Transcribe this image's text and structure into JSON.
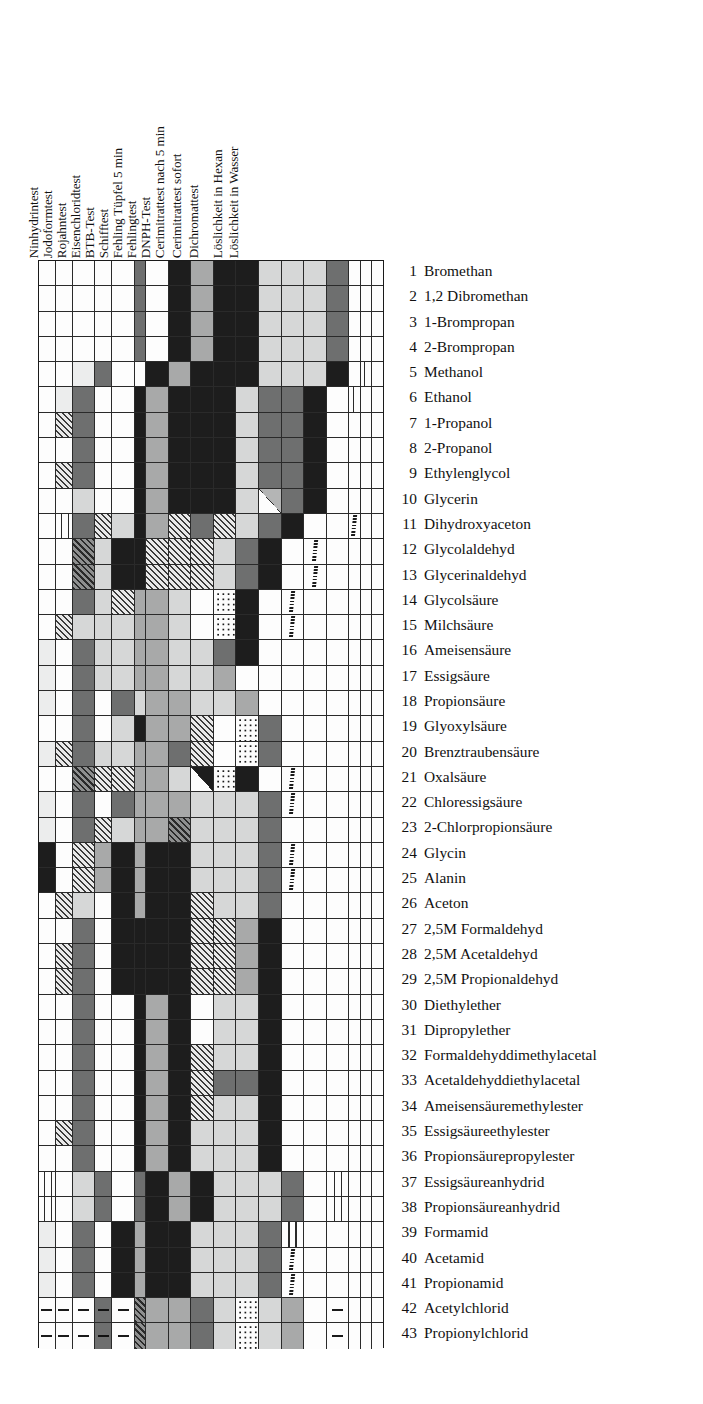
{
  "figure": {
    "caption": ""
  },
  "chart_data": {
    "type": "heatmap",
    "xlabel": "",
    "ylabel": "",
    "grid": true,
    "legend_position": "none",
    "orientation": "columns = tests (rotated labels, left to right), rows = substances 1..43",
    "categories": [
      "Ninhydrintest",
      "Jodoformtest",
      "Rojahntest",
      "Eisenchloridtest",
      "BTB-Test",
      "Schifftest",
      "Fehling Tüpfel 5 min",
      "Fehlingtest",
      "DNPH-Test",
      "Cerimitrattest nach 5 min",
      "Cerimitrattest sofort",
      "Dichromattest",
      "Löslichkeit in Hexan",
      "Löslichkeit in Wasser"
    ],
    "column_labels": [
      "Ninhydrintest",
      "Jodoformtest",
      "Rojahntest",
      "Eisenchloridtest",
      "BTB-Test",
      "Schifftest",
      "Fehling Tüpfel 5 min",
      "Fehlingtest",
      "DNPH-Test",
      "Cerimitrattest nach 5 min",
      "Cerimitrattest sofort",
      "Dichromattest",
      "Löslichkeit in Hexan",
      "Löslichkeit in Wasser"
    ],
    "value_scale": {
      "w": "white / no reaction",
      "vl": "very light gray",
      "l": "light gray",
      "m": "medium gray",
      "d": "dark gray",
      "k": "black / strong reaction",
      "h": "hatched (diagonal)",
      "hd": "dark hatched",
      "dot": "dotted",
      "tri": "split cell (diagonal)",
      "sq": "wavy-line marker",
      "dash": "dash marker"
    },
    "rows": [
      {
        "n": "1",
        "name": "Bromethan",
        "cells": [
          "w",
          "w",
          "w",
          "w",
          "w",
          "d",
          "w",
          "k",
          "m",
          "k",
          "k",
          "l",
          "l",
          "l",
          "d",
          "w",
          "w",
          "w"
        ]
      },
      {
        "n": "2",
        "name": "1,2 Dibromethan",
        "cells": [
          "w",
          "w",
          "w",
          "w",
          "w",
          "d",
          "w",
          "k",
          "m",
          "k",
          "k",
          "l",
          "l",
          "l",
          "d",
          "w",
          "w",
          "w"
        ]
      },
      {
        "n": "3",
        "name": "1-Brompropan",
        "cells": [
          "w",
          "w",
          "w",
          "w",
          "w",
          "d",
          "w",
          "k",
          "m",
          "k",
          "k",
          "l",
          "l",
          "l",
          "d",
          "w",
          "w",
          "w"
        ]
      },
      {
        "n": "4",
        "name": "2-Brompropan",
        "cells": [
          "w",
          "w",
          "w",
          "w",
          "w",
          "d",
          "w",
          "k",
          "m",
          "k",
          "k",
          "l",
          "l",
          "l",
          "d",
          "w",
          "w",
          "w"
        ]
      },
      {
        "n": "5",
        "name": "Methanol",
        "cells": [
          "w",
          "w",
          "vl",
          "d",
          "w",
          "w",
          "k",
          "m",
          "k",
          "k",
          "k",
          "l",
          "l",
          "l",
          "k",
          "w",
          "wv",
          "w"
        ]
      },
      {
        "n": "6",
        "name": "Ethanol",
        "cells": [
          "w",
          "vl",
          "d",
          "w",
          "w",
          "k",
          "m",
          "k",
          "k",
          "k",
          "l",
          "d",
          "d",
          "k",
          "w",
          "wv",
          "w",
          "w"
        ]
      },
      {
        "n": "7",
        "name": "1-Propanol",
        "cells": [
          "w",
          "h",
          "d",
          "w",
          "w",
          "k",
          "m",
          "k",
          "k",
          "k",
          "l",
          "d",
          "d",
          "k",
          "w",
          "w",
          "w",
          "w"
        ]
      },
      {
        "n": "8",
        "name": "2-Propanol",
        "cells": [
          "w",
          "w",
          "d",
          "w",
          "w",
          "k",
          "m",
          "k",
          "k",
          "k",
          "l",
          "d",
          "d",
          "k",
          "w",
          "w",
          "w",
          "w"
        ]
      },
      {
        "n": "9",
        "name": "Ethylenglycol",
        "cells": [
          "w",
          "h",
          "d",
          "w",
          "w",
          "k",
          "m",
          "k",
          "k",
          "k",
          "l",
          "d",
          "d",
          "k",
          "w",
          "w",
          "w",
          "w"
        ]
      },
      {
        "n": "10",
        "name": "Glycerin",
        "cells": [
          "w",
          "w",
          "l",
          "w",
          "w",
          "k",
          "m",
          "k",
          "k",
          "k",
          "l",
          "tri",
          "d",
          "k",
          "w",
          "w",
          "w",
          "w"
        ]
      },
      {
        "n": "11",
        "name": "Dihydroxyaceton",
        "cells": [
          "w",
          "wv",
          "d",
          "h",
          "l",
          "k",
          "m",
          "h",
          "d",
          "h",
          "l",
          "d",
          "k",
          "w",
          "w",
          "sq",
          "w",
          "w"
        ]
      },
      {
        "n": "12",
        "name": "Glycolaldehyd",
        "cells": [
          "w",
          "w",
          "hd",
          "l",
          "k",
          "k",
          "h",
          "h",
          "h",
          "l",
          "d",
          "k",
          "w",
          "sq",
          "w",
          "w",
          "w",
          "w"
        ]
      },
      {
        "n": "13",
        "name": "Glycerinaldehyd",
        "cells": [
          "w",
          "w",
          "hd",
          "l",
          "k",
          "k",
          "h",
          "h",
          "h",
          "l",
          "d",
          "k",
          "w",
          "sq",
          "w",
          "w",
          "w",
          "w"
        ]
      },
      {
        "n": "14",
        "name": "Glycolsäure",
        "cells": [
          "w",
          "w",
          "d",
          "l",
          "h",
          "m",
          "m",
          "l",
          "w",
          "dot",
          "k",
          "w",
          "sq",
          "w",
          "w",
          "w",
          "w",
          "w"
        ]
      },
      {
        "n": "15",
        "name": "Milchsäure",
        "cells": [
          "w",
          "h",
          "l",
          "l",
          "l",
          "m",
          "m",
          "l",
          "w",
          "dot",
          "k",
          "w",
          "sq",
          "w",
          "w",
          "w",
          "w",
          "w"
        ]
      },
      {
        "n": "16",
        "name": "Ameisensäure",
        "cells": [
          "vl",
          "w",
          "d",
          "l",
          "l",
          "m",
          "m",
          "l",
          "l",
          "d",
          "k",
          "w",
          "w",
          "w",
          "w",
          "w",
          "w",
          "w"
        ]
      },
      {
        "n": "17",
        "name": "Essigsäure",
        "cells": [
          "vl",
          "w",
          "d",
          "l",
          "l",
          "m",
          "m",
          "l",
          "l",
          "m",
          "w",
          "w",
          "w",
          "w",
          "w",
          "w",
          "w",
          "w"
        ]
      },
      {
        "n": "18",
        "name": "Propionsäure",
        "cells": [
          "vl",
          "w",
          "d",
          "w",
          "d",
          "l",
          "m",
          "m",
          "l",
          "l",
          "m",
          "w",
          "w",
          "w",
          "w",
          "w",
          "w",
          "w"
        ]
      },
      {
        "n": "19",
        "name": "Glyoxylsäure",
        "cells": [
          "w",
          "w",
          "d",
          "w",
          "l",
          "k",
          "m",
          "m",
          "h",
          "w",
          "dot",
          "d",
          "w",
          "w",
          "w",
          "w",
          "w",
          "w"
        ]
      },
      {
        "n": "20",
        "name": "Brenztraubensäure",
        "cells": [
          "vl",
          "h",
          "d",
          "l",
          "l",
          "m",
          "m",
          "d",
          "h",
          "w",
          "dot",
          "d",
          "w",
          "w",
          "w",
          "w",
          "w",
          "w"
        ]
      },
      {
        "n": "21",
        "name": "Oxalsäure",
        "cells": [
          "w",
          "w",
          "hd",
          "h",
          "h",
          "m",
          "m",
          "l",
          "tri2",
          "dot",
          "k",
          "w",
          "sq",
          "w",
          "w",
          "w",
          "w",
          "w"
        ]
      },
      {
        "n": "22",
        "name": "Chloressigsäure",
        "cells": [
          "vl",
          "w",
          "d",
          "w",
          "d",
          "m",
          "m",
          "m",
          "l",
          "l",
          "l",
          "d",
          "sq",
          "w",
          "w",
          "w",
          "w",
          "w"
        ]
      },
      {
        "n": "23",
        "name": "2-Chlorpropionsäure",
        "cells": [
          "vl",
          "w",
          "d",
          "h",
          "l",
          "m",
          "m",
          "hd",
          "l",
          "l",
          "l",
          "d",
          "w",
          "w",
          "w",
          "w",
          "w",
          "w"
        ]
      },
      {
        "n": "24",
        "name": "Glycin",
        "cells": [
          "k",
          "w",
          "h",
          "m",
          "k",
          "m",
          "k",
          "k",
          "l",
          "l",
          "l",
          "d",
          "sq",
          "w",
          "w",
          "w",
          "w",
          "w"
        ]
      },
      {
        "n": "25",
        "name": "Alanin",
        "cells": [
          "k",
          "w",
          "h",
          "m",
          "k",
          "m",
          "k",
          "k",
          "l",
          "l",
          "l",
          "d",
          "sq",
          "w",
          "w",
          "w",
          "w",
          "w"
        ]
      },
      {
        "n": "26",
        "name": "Aceton",
        "cells": [
          "w",
          "h",
          "l",
          "w",
          "k",
          "m",
          "k",
          "k",
          "h",
          "l",
          "l",
          "d",
          "w",
          "w",
          "w",
          "w",
          "w",
          "w"
        ]
      },
      {
        "n": "27",
        "name": "2,5M Formaldehyd",
        "cells": [
          "w",
          "w",
          "d",
          "w",
          "k",
          "k",
          "k",
          "k",
          "h",
          "h",
          "m",
          "k",
          "w",
          "w",
          "w",
          "w",
          "w",
          "w"
        ]
      },
      {
        "n": "28",
        "name": "2,5M Acetaldehyd",
        "cells": [
          "w",
          "h",
          "d",
          "w",
          "k",
          "k",
          "k",
          "k",
          "h",
          "h",
          "m",
          "k",
          "w",
          "w",
          "w",
          "w",
          "w",
          "w"
        ]
      },
      {
        "n": "29",
        "name": "2,5M Propionaldehyd",
        "cells": [
          "w",
          "h",
          "d",
          "w",
          "k",
          "k",
          "k",
          "k",
          "h",
          "h",
          "m",
          "k",
          "w",
          "w",
          "w",
          "w",
          "w",
          "w"
        ]
      },
      {
        "n": "30",
        "name": "Diethylether",
        "cells": [
          "w",
          "w",
          "d",
          "w",
          "w",
          "k",
          "m",
          "k",
          "w",
          "l",
          "l",
          "k",
          "w",
          "w",
          "w",
          "w",
          "w",
          "w"
        ]
      },
      {
        "n": "31",
        "name": "Dipropylether",
        "cells": [
          "w",
          "w",
          "d",
          "w",
          "w",
          "k",
          "m",
          "k",
          "w",
          "l",
          "l",
          "k",
          "w",
          "w",
          "w",
          "w",
          "w",
          "w"
        ]
      },
      {
        "n": "32",
        "name": "Formaldehyddimethylacetal",
        "cells": [
          "w",
          "w",
          "d",
          "w",
          "w",
          "k",
          "m",
          "k",
          "h",
          "l",
          "l",
          "k",
          "w",
          "w",
          "w",
          "w",
          "w",
          "w"
        ]
      },
      {
        "n": "33",
        "name": "Acetaldehyddiethylacetal",
        "cells": [
          "w",
          "w",
          "d",
          "w",
          "w",
          "k",
          "m",
          "k",
          "h",
          "d",
          "d",
          "k",
          "w",
          "w",
          "w",
          "w",
          "w",
          "w"
        ]
      },
      {
        "n": "34",
        "name": "Ameisensäuremethylester",
        "cells": [
          "w",
          "w",
          "d",
          "w",
          "w",
          "k",
          "m",
          "k",
          "h",
          "l",
          "l",
          "k",
          "w",
          "w",
          "w",
          "w",
          "w",
          "w"
        ]
      },
      {
        "n": "35",
        "name": "Essigsäureethylester",
        "cells": [
          "w",
          "h",
          "d",
          "w",
          "w",
          "k",
          "m",
          "k",
          "l",
          "l",
          "l",
          "k",
          "w",
          "w",
          "w",
          "w",
          "w",
          "w"
        ]
      },
      {
        "n": "36",
        "name": "Propionsäurepropylester",
        "cells": [
          "w",
          "w",
          "d",
          "w",
          "w",
          "k",
          "m",
          "k",
          "l",
          "l",
          "l",
          "k",
          "w",
          "w",
          "w",
          "w",
          "w",
          "w"
        ]
      },
      {
        "n": "37",
        "name": "Essigsäureanhydrid",
        "cells": [
          "wv",
          "w",
          "l",
          "d",
          "w",
          "d",
          "k",
          "m",
          "k",
          "l",
          "l",
          "l",
          "d",
          "w",
          "wv",
          "w",
          "w",
          "w"
        ]
      },
      {
        "n": "38",
        "name": "Propionsäureanhydrid",
        "cells": [
          "wv",
          "w",
          "l",
          "d",
          "w",
          "d",
          "k",
          "m",
          "k",
          "l",
          "l",
          "l",
          "d",
          "w",
          "wv",
          "w",
          "w",
          "w"
        ]
      },
      {
        "n": "39",
        "name": "Formamid",
        "cells": [
          "vl",
          "w",
          "d",
          "w",
          "k",
          "m",
          "k",
          "k",
          "l",
          "l",
          "l",
          "d",
          "wv",
          "w",
          "w",
          "w",
          "w",
          "w"
        ]
      },
      {
        "n": "40",
        "name": "Acetamid",
        "cells": [
          "vl",
          "w",
          "d",
          "w",
          "k",
          "m",
          "k",
          "k",
          "l",
          "l",
          "l",
          "d",
          "sq",
          "w",
          "w",
          "w",
          "w",
          "w"
        ]
      },
      {
        "n": "41",
        "name": "Propionamid",
        "cells": [
          "vl",
          "w",
          "d",
          "w",
          "k",
          "m",
          "k",
          "k",
          "l",
          "l",
          "l",
          "d",
          "sq",
          "w",
          "w",
          "w",
          "w",
          "w"
        ]
      },
      {
        "n": "42",
        "name": "Acetylchlorid",
        "cells": [
          "dash",
          "dash",
          "dash",
          "dashd",
          "dash",
          "hd",
          "m",
          "m",
          "d",
          "l",
          "dot",
          "l",
          "m",
          "w",
          "dash",
          "w",
          "w",
          "w"
        ]
      },
      {
        "n": "43",
        "name": "Propionylchlorid",
        "cells": [
          "dash",
          "dash",
          "dash",
          "dashd",
          "dash",
          "hd",
          "m",
          "m",
          "d",
          "l",
          "dot",
          "l",
          "m",
          "w",
          "dash",
          "w",
          "w",
          "w"
        ]
      }
    ]
  },
  "matrix": {
    "columns": [
      {
        "label": "Ninhydrintest",
        "x": 0,
        "w": 21.6
      },
      {
        "label": "Jodoformtest",
        "x": 22,
        "w": 21.6
      },
      {
        "label": "Rojahntest",
        "x": 44,
        "w": 21.6
      },
      {
        "label": "Eisenchloridtest",
        "x": 66,
        "w": 21.6
      },
      {
        "label": "BTB-Test",
        "x": 88,
        "w": 21.6
      },
      {
        "label": "Schifftest",
        "x": 110,
        "w": 21.6
      },
      {
        "label": "Fehling Tüpfel 5 min",
        "x": 132,
        "w": 21.6
      },
      {
        "label": "Fehlingtest",
        "x": 154,
        "w": 21.6
      },
      {
        "label": "DNPH-Test",
        "x": 176,
        "w": 21.6
      },
      {
        "label": "Cerimitrattest nach 5 min",
        "x": 198,
        "w": 21.6
      },
      {
        "label": "Cerimitrattest sofort",
        "x": 220,
        "w": 21.6
      },
      {
        "label": "Dichromattest",
        "x": 242,
        "w": 21.6
      },
      {
        "label": "Löslichkeit in Hexan",
        "x": 264,
        "w": 21.6
      },
      {
        "label": "Löslichkeit in Wasser",
        "x": 286,
        "w": 21.6
      }
    ],
    "header_positions": [
      {
        "label": "Ninhydrintest",
        "left": 2,
        "fs": 13.2
      },
      {
        "label": "Jodoformtest",
        "left": 16,
        "fs": 13.2
      },
      {
        "label": "Rojahntest",
        "left": 30,
        "fs": 13.2
      },
      {
        "label": "Eisenchloridtest",
        "left": 44,
        "fs": 13.2
      },
      {
        "label": "BTB-Test",
        "left": 58,
        "fs": 13.2
      },
      {
        "label": "Schifftest",
        "left": 72,
        "fs": 13.2
      },
      {
        "label": "Fehling Tüpfel 5 min",
        "left": 86,
        "fs": 13.2
      },
      {
        "label": "Fehlingtest",
        "left": 100,
        "fs": 13.2
      },
      {
        "label": "DNPH-Test",
        "left": 114,
        "fs": 13.2
      },
      {
        "label": "Cerimitrattest nach 5 min",
        "left": 128,
        "fs": 13.2
      },
      {
        "label": "Cerimitrattest sofort",
        "left": 145,
        "fs": 13.2
      },
      {
        "label": "Dichromattest",
        "left": 162,
        "fs": 13.2
      },
      {
        "label": "Löslichkeit in Hexan",
        "left": 186,
        "fs": 13.2
      },
      {
        "label": "Löslichkeit in Wasser",
        "left": 202,
        "fs": 13.2
      }
    ]
  }
}
